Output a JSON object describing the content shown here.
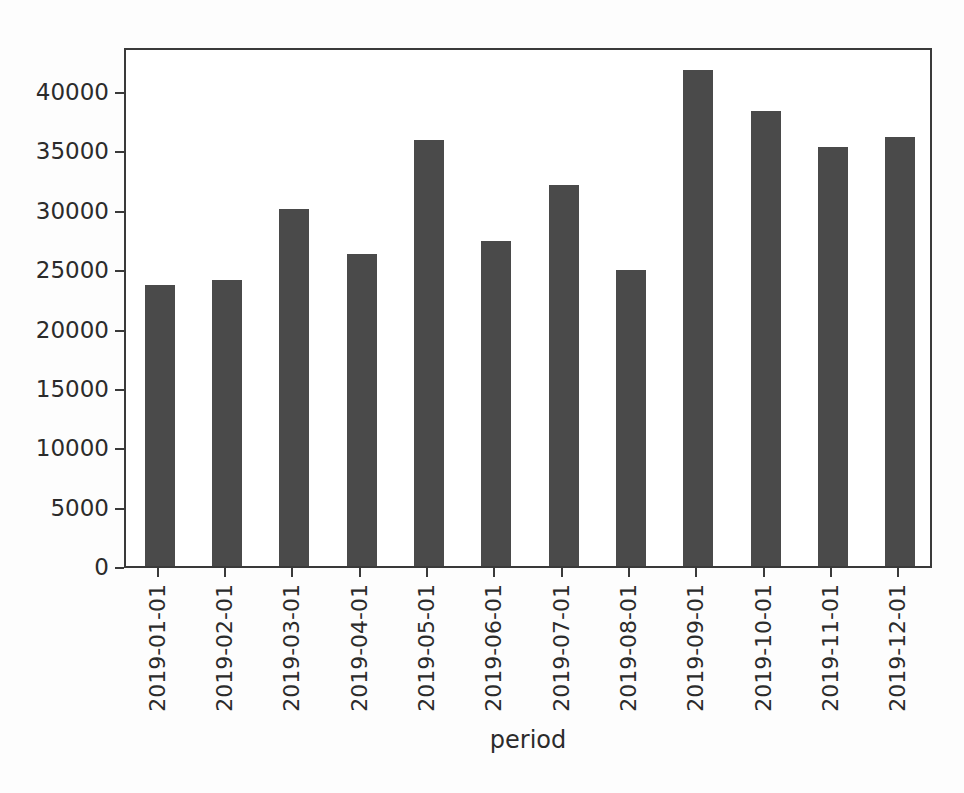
{
  "chart_data": {
    "type": "bar",
    "title": "",
    "xlabel": "period",
    "ylabel": "",
    "categories": [
      "2019-01-01",
      "2019-02-01",
      "2019-03-01",
      "2019-04-01",
      "2019-05-01",
      "2019-06-01",
      "2019-07-01",
      "2019-08-01",
      "2019-09-01",
      "2019-10-01",
      "2019-11-01",
      "2019-12-01"
    ],
    "values": [
      23700,
      24100,
      30100,
      26300,
      35900,
      27400,
      32100,
      24900,
      41800,
      38300,
      35300,
      36100
    ],
    "ylim": [
      0,
      43800
    ],
    "yticks": [
      0,
      5000,
      10000,
      15000,
      20000,
      25000,
      30000,
      35000,
      40000
    ],
    "ytick_labels": [
      "0",
      "5000",
      "10000",
      "15000",
      "20000",
      "25000",
      "30000",
      "35000",
      "40000"
    ],
    "grid": false,
    "legend": null,
    "bar_color": "#4a4a4a",
    "axis_color": "#3a3a3a",
    "background": "#ffffff"
  }
}
